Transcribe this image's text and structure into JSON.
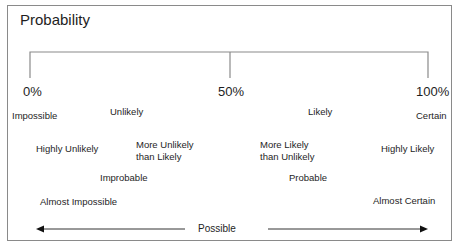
{
  "title": "Probability",
  "scale": {
    "min_label": "0%",
    "mid_label": "50%",
    "max_label": "100%"
  },
  "terms": {
    "impossible": "Impossible",
    "unlikely": "Unlikely",
    "likely": "Likely",
    "certain": "Certain",
    "highly_unlikely": "Highly Unlikely",
    "more_unlikely_than_likely_1": "More Unlikely",
    "more_unlikely_than_likely_2": "than Likely",
    "more_likely_than_unlikely_1": "More Likely",
    "more_likely_than_unlikely_2": "than Unlikely",
    "highly_likely": "Highly Likely",
    "improbable": "Improbable",
    "probable": "Probable",
    "almost_impossible": "Almost Impossible",
    "almost_certain": "Almost Certain"
  },
  "arrow_label": "Possible",
  "colors": {
    "line": "#8a8a8a",
    "arrow": "#222222",
    "text": "#1e1e1e"
  }
}
